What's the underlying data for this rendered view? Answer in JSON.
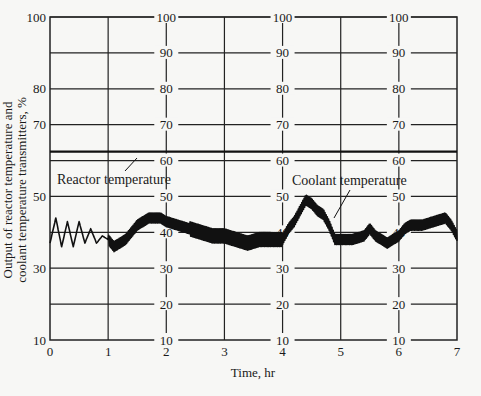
{
  "chart_data": {
    "type": "line",
    "title": "",
    "xlabel": "Time, hr",
    "ylabel_line1": "Output of reactor temperature and",
    "ylabel_line2": "coolant temperature transmitters, %",
    "xlim": [
      0,
      7
    ],
    "ylim": [
      10,
      100
    ],
    "grid": true,
    "x_ticks": [
      0,
      1,
      2,
      3,
      4,
      5,
      6,
      7
    ],
    "y_ticks_left": [
      10,
      30,
      50,
      70,
      80,
      100
    ],
    "y_ticks_inner": [
      10,
      20,
      30,
      40,
      50,
      60,
      70,
      80,
      90,
      100
    ],
    "y_gridlines": [
      20,
      30,
      40,
      50,
      60,
      70,
      80,
      90,
      100
    ],
    "inner_scale_positions_x": [
      2,
      4,
      6
    ],
    "annotations": [
      {
        "text": "Reactor temperature",
        "points_to": "reactor-temperature-line"
      },
      {
        "text": "Coolant temperature",
        "points_to": "coolant-temperature-trace"
      }
    ],
    "series": [
      {
        "name": "Reactor temperature",
        "x": [
          0,
          7
        ],
        "values": [
          62.5,
          62.5
        ]
      },
      {
        "name": "Coolant temperature",
        "x": [
          0,
          0.1,
          0.2,
          0.3,
          0.4,
          0.5,
          0.6,
          0.7,
          0.8,
          0.9,
          1.0,
          1.1,
          1.2,
          1.3,
          1.4,
          1.5,
          1.6,
          1.7,
          1.8,
          1.9,
          2.0,
          2.2,
          2.4,
          2.6,
          2.8,
          3.0,
          3.2,
          3.4,
          3.6,
          3.8,
          4.0,
          4.1,
          4.2,
          4.3,
          4.4,
          4.5,
          4.6,
          4.7,
          4.8,
          4.9,
          5.0,
          5.2,
          5.4,
          5.5,
          5.6,
          5.8,
          6.0,
          6.1,
          6.2,
          6.4,
          6.6,
          6.8,
          6.9,
          7.0
        ],
        "values": [
          37,
          44,
          36,
          43,
          36,
          43,
          37,
          41,
          37,
          39,
          38,
          36,
          37,
          38,
          40,
          42,
          43,
          44,
          44,
          44,
          43,
          42,
          41,
          40,
          39,
          39,
          38,
          37,
          38,
          38,
          38,
          41,
          43,
          46,
          49,
          48,
          46,
          45,
          42,
          38,
          38,
          38,
          39,
          41,
          39,
          37,
          39,
          41,
          42,
          42,
          43,
          44,
          42,
          39
        ]
      }
    ]
  }
}
